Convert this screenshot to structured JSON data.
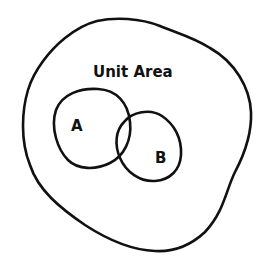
{
  "diagram": {
    "type": "venn",
    "universe_label": "Unit Area",
    "sets": [
      {
        "label": "A"
      },
      {
        "label": "B"
      }
    ],
    "stroke_color": "#111111",
    "background": "#ffffff"
  }
}
